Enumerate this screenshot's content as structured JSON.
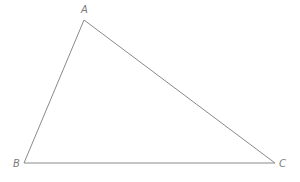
{
  "diagram": {
    "type": "triangle",
    "stroke_color": "#8a8a8a",
    "label_color": "#7a7a7a",
    "vertices": [
      {
        "name": "A",
        "x": 84,
        "y": 20,
        "label_x": 81,
        "label_y": 13
      },
      {
        "name": "B",
        "x": 24,
        "y": 163,
        "label_x": 13,
        "label_y": 167
      },
      {
        "name": "C",
        "x": 275,
        "y": 163,
        "label_x": 279,
        "label_y": 167
      }
    ],
    "edges": [
      {
        "from": "A",
        "to": "B"
      },
      {
        "from": "B",
        "to": "C"
      },
      {
        "from": "C",
        "to": "A"
      }
    ]
  }
}
